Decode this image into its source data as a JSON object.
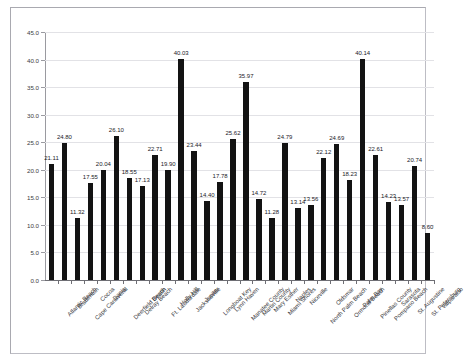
{
  "chart_data": {
    "type": "bar",
    "title": "",
    "xlabel": "",
    "ylabel": "",
    "ylim": [
      0,
      45
    ],
    "ytick_step": 5,
    "grid": true,
    "legend": null,
    "bar_color": "#131313",
    "gridline_color": "#e2e2e6",
    "axis_color": "#6e6e74",
    "yticks": [
      "0.0",
      "5.0",
      "10.0",
      "15.0",
      "20.0",
      "25.0",
      "30.0",
      "35.0",
      "40.0",
      "45.0"
    ],
    "categories": [
      "Atlantic Beach",
      "Bradenton",
      "Cape Canaveral",
      "Cocoa",
      "Dania",
      "Deerfield Beach",
      "Delray Beach",
      "Destin",
      "Ft. Lauderdale",
      "Holly Hill",
      "Jacksonville",
      "Jupiter",
      "Longboat Key",
      "Lynn Haven",
      "Manatee County",
      "Martin County",
      "Mary Esther",
      "Miami Shores",
      "Naples",
      "Niceville",
      "North Palm Beach",
      "Oldsmar",
      "Ormond Beach",
      "Palm Bay",
      "Pinellas County",
      "Pompano Beach",
      "Sarasota",
      "St. Augustine",
      "St. Petersburg",
      "Valparaiso"
    ],
    "values": [
      21.11,
      24.8,
      11.32,
      17.55,
      20.04,
      26.1,
      18.55,
      17.13,
      22.71,
      19.9,
      40.03,
      23.44,
      14.4,
      17.78,
      25.62,
      35.97,
      14.72,
      11.28,
      24.79,
      13.14,
      13.56,
      22.12,
      24.69,
      18.23,
      40.14,
      22.61,
      14.23,
      13.57,
      20.74,
      8.6
    ],
    "value_labels": [
      "21.11",
      "24.80",
      "11.32",
      "17.55",
      "20.04",
      "26.10",
      "18.55",
      "17.13",
      "22.71",
      "19.90",
      "40.03",
      "23.44",
      "14.40",
      "17.78",
      "25.62",
      "35.97",
      "14.72",
      "11.28",
      "24.79",
      "13.14",
      "13.56",
      "22.12",
      "24.69",
      "18.23",
      "40.14",
      "22.61",
      "14.23",
      "13.57",
      "20.74",
      "8.60"
    ]
  }
}
